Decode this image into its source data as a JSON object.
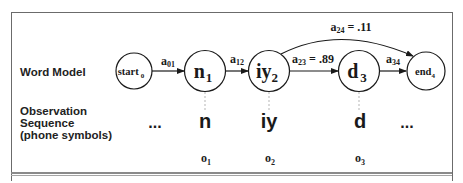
{
  "row_labels": {
    "word_model": "Word Model",
    "observation_line1": "Observation",
    "observation_line2": "Sequence",
    "observation_line3": "(phone symbols)"
  },
  "states": [
    {
      "id": "start",
      "label": "start",
      "sub": "0"
    },
    {
      "id": "n",
      "label": "n",
      "sub": "1"
    },
    {
      "id": "iy",
      "label": "iy",
      "sub": "2"
    },
    {
      "id": "d",
      "label": "d",
      "sub": "3"
    },
    {
      "id": "end",
      "label": "end",
      "sub": "4"
    }
  ],
  "transitions": [
    {
      "from": "start",
      "to": "n",
      "label": "a",
      "sub": "01",
      "value": ""
    },
    {
      "from": "n",
      "to": "iy",
      "label": "a",
      "sub": "12",
      "value": ""
    },
    {
      "from": "iy",
      "to": "d",
      "label": "a",
      "sub": "23",
      "value": " = .89"
    },
    {
      "from": "d",
      "to": "end",
      "label": "a",
      "sub": "34",
      "value": ""
    },
    {
      "from": "iy",
      "to": "end",
      "label": "a",
      "sub": "24",
      "value": " = .11"
    }
  ],
  "observations": {
    "leading_ellipsis": "...",
    "symbols": [
      "n",
      "iy",
      "d"
    ],
    "trailing_ellipsis": "...",
    "indices": [
      {
        "label": "o",
        "sub": "1"
      },
      {
        "label": "o",
        "sub": "2"
      },
      {
        "label": "o",
        "sub": "3"
      }
    ]
  }
}
